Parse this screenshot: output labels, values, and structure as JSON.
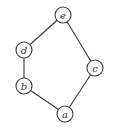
{
  "diagram": {
    "type": "undirected-graph",
    "width": 122,
    "height": 133,
    "node_radius": 8,
    "colors": {
      "stroke": "#3a3a3a",
      "fill": "#ffffff",
      "label": "#333333"
    },
    "nodes": [
      {
        "id": "e",
        "label": "e",
        "x": 63,
        "y": 15
      },
      {
        "id": "d",
        "label": "d",
        "x": 24,
        "y": 50
      },
      {
        "id": "b",
        "label": "b",
        "x": 24,
        "y": 86
      },
      {
        "id": "c",
        "label": "c",
        "x": 95,
        "y": 68
      },
      {
        "id": "a",
        "label": "a",
        "x": 65,
        "y": 114
      }
    ],
    "edges": [
      {
        "from": "e",
        "to": "d"
      },
      {
        "from": "d",
        "to": "b"
      },
      {
        "from": "b",
        "to": "a"
      },
      {
        "from": "a",
        "to": "c"
      },
      {
        "from": "c",
        "to": "e"
      }
    ]
  }
}
